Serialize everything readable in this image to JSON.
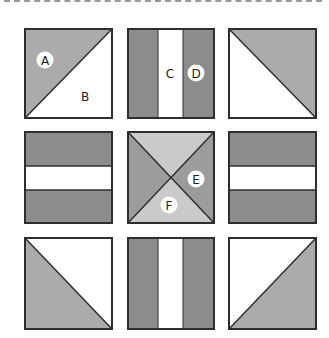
{
  "diagram": {
    "colors": {
      "light_gray": "#ababab",
      "dark_gray": "#8c8c8c",
      "center_light": "#cacaca",
      "center_dark": "#9c9c9c",
      "white": "#ffffff",
      "border": "#2e2e2e"
    },
    "blocks": [
      {
        "row": 0,
        "col": 0,
        "type": "half-square-triangle",
        "shaded": "top-left"
      },
      {
        "row": 0,
        "col": 1,
        "type": "vertical-stripes"
      },
      {
        "row": 0,
        "col": 2,
        "type": "half-square-triangle",
        "shaded": "top-right"
      },
      {
        "row": 1,
        "col": 0,
        "type": "horizontal-stripes"
      },
      {
        "row": 1,
        "col": 1,
        "type": "hourglass"
      },
      {
        "row": 1,
        "col": 2,
        "type": "horizontal-stripes"
      },
      {
        "row": 2,
        "col": 0,
        "type": "half-square-triangle",
        "shaded": "bottom-left"
      },
      {
        "row": 2,
        "col": 1,
        "type": "vertical-stripes"
      },
      {
        "row": 2,
        "col": 2,
        "type": "half-square-triangle",
        "shaded": "bottom-right"
      }
    ],
    "labels": {
      "a": "A",
      "b": "B",
      "c": "C",
      "d": "D",
      "e": "E",
      "f": "F"
    }
  }
}
